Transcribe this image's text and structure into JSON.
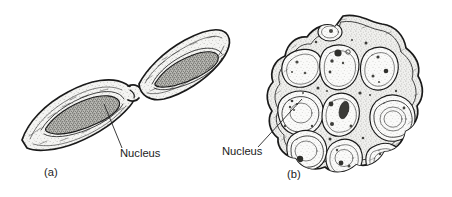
{
  "figure": {
    "background_color": "#ffffff",
    "ink_color": "#1a1a1a",
    "style": "pen-and-ink stipple line drawing",
    "width": 452,
    "height": 197
  },
  "panels": [
    {
      "id": "a",
      "caption": "(a)",
      "caption_x": 44,
      "caption_y": 176,
      "description": "Two elongated spindle-shaped uninucleate cells joined end to end at a narrow isthmus, oriented diagonally",
      "cell_count": 2,
      "annotation": {
        "label": "Nucleus",
        "label_x": 120,
        "label_y": 157,
        "leader_from_x": 104,
        "leader_from_y": 104,
        "leader_to_x": 122,
        "leader_to_y": 148
      }
    },
    {
      "id": "b",
      "caption": "(b)",
      "caption_x": 287,
      "caption_y": 178,
      "description": "Rounded lobed multicellular mass packed with about ten rounded cells, each containing a nucleus",
      "cell_count": 10,
      "annotation": {
        "label": "Nucleus",
        "label_x": 222,
        "label_y": 155,
        "leader_from_x": 302,
        "leader_from_y": 99,
        "leader_to_x": 258,
        "leader_to_y": 147
      }
    }
  ],
  "colors": {
    "cytoplasm_fill": "#ececea",
    "nucleus_fill": "#8b8b86",
    "nucleus_dark": "#3d3d3a",
    "outline": "#1a1a1a",
    "background": "#ffffff"
  }
}
